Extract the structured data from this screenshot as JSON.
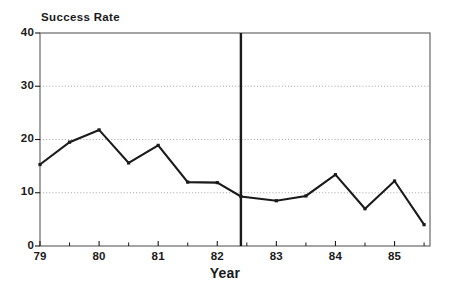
{
  "chart_data": {
    "type": "line",
    "title": "",
    "xlabel": "Year",
    "ylabel": "Success Rate",
    "ylim": [
      0,
      40
    ],
    "xlim": [
      79,
      85.6
    ],
    "grid": "horizontal-dotted",
    "legend": "none",
    "yticks": [
      0,
      10,
      20,
      30,
      40
    ],
    "ytick_labels": [
      "0",
      "10",
      "20",
      "30",
      "40"
    ],
    "xticks": [
      79,
      80,
      81,
      82,
      83,
      84,
      85
    ],
    "xtick_labels": [
      "79",
      "80",
      "81",
      "82",
      "83",
      "84",
      "85"
    ],
    "xminor_ticks": [
      79.5,
      80.5,
      81.5,
      82.5,
      83.5,
      84.5,
      85.5
    ],
    "x": [
      79,
      79.5,
      80,
      80.5,
      81,
      81.5,
      82,
      82.4,
      83,
      83.5,
      84,
      84.5,
      85,
      85.5
    ],
    "series": [
      {
        "name": "Success Rate",
        "color": "#1a1a1a",
        "marker": "square",
        "values": [
          15.3,
          19.5,
          21.8,
          15.6,
          18.9,
          12.0,
          11.9,
          9.3,
          8.5,
          9.4,
          13.4,
          7.0,
          12.2,
          4.0
        ]
      }
    ],
    "annotations": [
      {
        "type": "vertical-reference-line",
        "x": 82.4,
        "color": "#1a1a1a",
        "label": ""
      }
    ]
  },
  "axes": {
    "frame_color": "#5a5a5a",
    "grid_color": "#9a9a9a",
    "line_color": "#1a1a1a"
  }
}
